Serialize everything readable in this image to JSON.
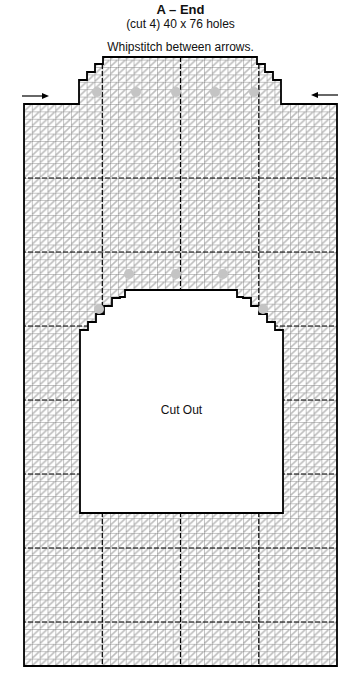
{
  "header": {
    "title": "A – End",
    "subtitle": "(cut 4) 40 x 76 holes",
    "instruction": "Whipstitch between arrows."
  },
  "pattern": {
    "width_holes": 40,
    "height_holes": 76,
    "cut_count": 4,
    "cutout_label": "Cut Out",
    "grid_color": "#222222",
    "stitch_color": "#b8b8b8",
    "marker_color": "#c4c4c4",
    "arrow_left": "right-arrow",
    "arrow_right": "left-arrow"
  }
}
